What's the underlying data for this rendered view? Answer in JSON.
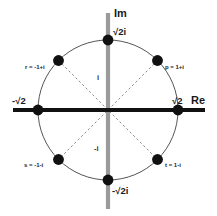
{
  "figure": {
    "colors": {
      "real_axis": "#111111",
      "imag_axis": "#9a9a9a",
      "circle": "#555555",
      "dot": "#101010",
      "dashed": "#777777",
      "background": "#ffffff",
      "text": "#1a1a1a"
    },
    "geometry": {
      "center_x": 108,
      "center_y": 110,
      "radius": 70,
      "dot_radius": 5.2
    }
  },
  "axes": {
    "imaginary_label": "Im",
    "real_label": "Re",
    "imag_top_value": "√2i",
    "imag_bottom_value": "-√2i",
    "real_right_value": "√2",
    "real_left_value": "-√2",
    "unit_up": "i",
    "unit_down": "-i"
  },
  "points": [
    {
      "id": "p",
      "label": "p = 1+i",
      "angle_deg": 45,
      "value_re": 1,
      "value_im": 1
    },
    {
      "id": "r",
      "label": "r = -1+i",
      "angle_deg": 135,
      "value_re": -1,
      "value_im": 1
    },
    {
      "id": "s",
      "label": "s = -1-i",
      "angle_deg": 225,
      "value_re": -1,
      "value_im": -1
    },
    {
      "id": "t",
      "label": "t = 1-i",
      "angle_deg": 315,
      "value_re": 1,
      "value_im": -1
    },
    {
      "id": "top",
      "label": "",
      "angle_deg": 90,
      "value_re": 0,
      "value_im": 1.41421
    },
    {
      "id": "right",
      "label": "",
      "angle_deg": 0,
      "value_re": 1.41421,
      "value_im": 0
    },
    {
      "id": "bottom",
      "label": "",
      "angle_deg": 270,
      "value_re": 0,
      "value_im": -1.41421
    },
    {
      "id": "left",
      "label": "",
      "angle_deg": 180,
      "value_re": -1.41421,
      "value_im": 0
    }
  ]
}
